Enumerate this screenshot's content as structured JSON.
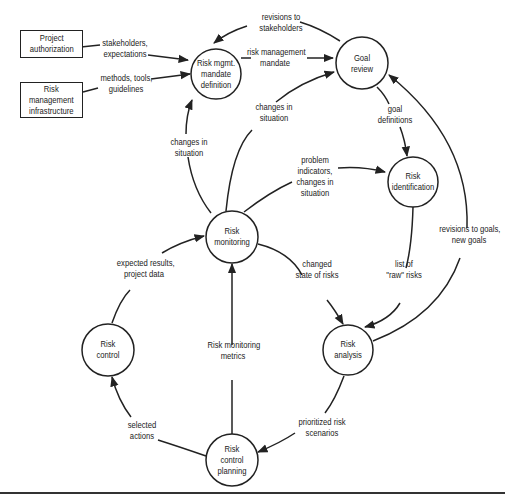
{
  "diagram": {
    "external_entities": [
      {
        "id": "project-authorization",
        "label": "Project\nauthorization"
      },
      {
        "id": "risk-management-infrastructure",
        "label": "Risk\nmanagement\ninfrastructure"
      }
    ],
    "processes": [
      {
        "id": "mandate-definition",
        "label": "Risk mgmt.\nmandate\ndefinition"
      },
      {
        "id": "goal-review",
        "label": "Goal\nreview"
      },
      {
        "id": "risk-identification",
        "label": "Risk\nidentification"
      },
      {
        "id": "risk-monitoring",
        "label": "Risk\nmonitoring"
      },
      {
        "id": "risk-analysis",
        "label": "Risk\nanalysis"
      },
      {
        "id": "risk-control",
        "label": "Risk\ncontrol"
      },
      {
        "id": "risk-control-planning",
        "label": "Risk\ncontrol\nplanning"
      }
    ],
    "flows": [
      {
        "from": "project-authorization",
        "to": "mandate-definition",
        "label": "stakeholders,\nexpectations"
      },
      {
        "from": "risk-management-infrastructure",
        "to": "mandate-definition",
        "label": "methods, tools,\nguidelines"
      },
      {
        "from": "goal-review",
        "to": "mandate-definition",
        "label": "revisions to\nstakeholders"
      },
      {
        "from": "mandate-definition",
        "to": "goal-review",
        "label": "risk management\nmandate"
      },
      {
        "from": "risk-monitoring",
        "to": "goal-review",
        "label": "changes in\nsituation"
      },
      {
        "from": "risk-monitoring",
        "to": "mandate-definition",
        "label": "changes in\nsituation"
      },
      {
        "from": "goal-review",
        "to": "risk-identification",
        "label": "goal\ndefinitions"
      },
      {
        "from": "risk-monitoring",
        "to": "risk-identification",
        "label": "problem\nindicators,\nchanges in\nsituation"
      },
      {
        "from": "risk-identification",
        "to": "risk-analysis",
        "label": "list of\n\"raw\" risks"
      },
      {
        "from": "risk-analysis",
        "to": "goal-review",
        "label": "revisions to goals,\nnew goals"
      },
      {
        "from": "risk-monitoring",
        "to": "risk-analysis",
        "label": "changed\nstate of risks"
      },
      {
        "from": "risk-control",
        "to": "risk-monitoring",
        "label": "expected results,\nproject data"
      },
      {
        "from": "risk-control-planning",
        "to": "risk-monitoring",
        "label": "Risk monitoring\nmetrics"
      },
      {
        "from": "risk-analysis",
        "to": "risk-control-planning",
        "label": "prioritized risk\nscenarios"
      },
      {
        "from": "risk-control-planning",
        "to": "risk-control",
        "label": "selected\nactions"
      }
    ]
  }
}
